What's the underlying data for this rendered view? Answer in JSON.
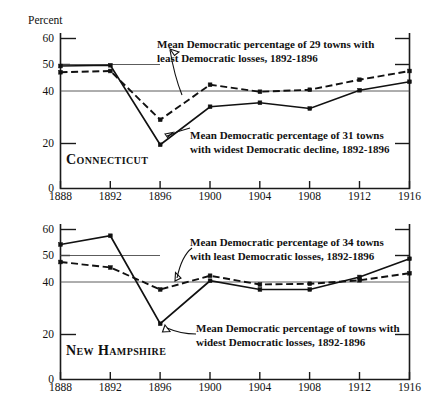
{
  "figure": {
    "background_color": "#ffffff",
    "ink_color": "#111111",
    "width": 443,
    "height": 412
  },
  "chart_data": [
    {
      "type": "line",
      "title": "Connecticut",
      "panel_label": "Connecticut",
      "xlabel": "",
      "ylabel": "Percent",
      "x": [
        1888,
        1892,
        1896,
        1900,
        1904,
        1908,
        1912,
        1916
      ],
      "xlim": [
        1888,
        1916
      ],
      "ylim": [
        0,
        62
      ],
      "xticks": [
        "1888",
        "1892",
        "1896",
        "1900",
        "1904",
        "1908",
        "1912",
        "1916"
      ],
      "yticks": [
        "0",
        "20",
        "40",
        "50",
        "60"
      ],
      "ytick_values": [
        0,
        20,
        40,
        50,
        60
      ],
      "grid": "horizontal reference lines at 40 (full width) and 50 (partial width)",
      "gridlines": [
        40,
        50
      ],
      "legend": "inline annotations with leader lines",
      "series": [
        {
          "name": "Mean Democratic percentage of 29 towns with least Democratic losses, 1892-1896",
          "style": "dashed",
          "values": [
            46.5,
            47.0,
            27.5,
            41.5,
            38.7,
            39.5,
            43.5,
            47.0
          ]
        },
        {
          "name": "Mean Democratic percentage of 31 towns with widest Democratic decline, 1892-1896",
          "style": "solid",
          "values": [
            49.0,
            49.3,
            17.5,
            32.7,
            34.3,
            32.0,
            39.3,
            42.7
          ]
        }
      ],
      "annotations": [
        {
          "id": "annotation-least-losses",
          "line1": "Mean Democratic percentage of 29 towns with",
          "line2": "least Democratic losses, 1892-1896",
          "points_to_series": "dashed"
        },
        {
          "id": "annotation-widest-decline",
          "line1": "Mean Democratic percentage of  31 towns",
          "line2": "with  widest Democratic decline, 1892-1896",
          "points_to_series": "solid"
        }
      ]
    },
    {
      "type": "line",
      "title": "New Hampshire",
      "panel_label": "New Hampshire",
      "xlabel": "",
      "ylabel": "",
      "x": [
        1888,
        1892,
        1896,
        1900,
        1904,
        1908,
        1912,
        1916
      ],
      "xlim": [
        1888,
        1916
      ],
      "ylim": [
        0,
        62
      ],
      "xticks": [
        "1888",
        "1892",
        "1896",
        "1900",
        "1904",
        "1908",
        "1912",
        "1916"
      ],
      "yticks": [
        "0",
        "20",
        "40",
        "50",
        "60"
      ],
      "ytick_values": [
        0,
        20,
        40,
        50,
        60
      ],
      "grid": "horizontal reference lines at 40 (full width) and 50 (partial width)",
      "gridlines": [
        40,
        50
      ],
      "legend": "inline annotations with leader lines",
      "series": [
        {
          "name": "Mean Democratic percentage of 34 towns with least Democratic losses, 1892-1896",
          "style": "dashed",
          "values": [
            47.0,
            44.8,
            36.0,
            41.5,
            38.0,
            38.3,
            39.7,
            42.5
          ]
        },
        {
          "name": "Mean Democratic percentage of towns with widest Democratic losses, 1892-1896",
          "style": "solid",
          "values": [
            54.0,
            57.5,
            22.3,
            39.5,
            36.0,
            36.0,
            41.0,
            48.3
          ]
        }
      ],
      "annotations": [
        {
          "id": "annotation-least-losses",
          "line1": "Mean Democratic percentage of  34  towns",
          "line2": "with least Democratic losses, 1892-1896",
          "points_to_series": "dashed"
        },
        {
          "id": "annotation-widest-losses",
          "line1": "Mean Democratic percentage of towns with",
          "line2": "widest Democratic losses, 1892-1896",
          "points_to_series": "solid"
        }
      ]
    }
  ]
}
